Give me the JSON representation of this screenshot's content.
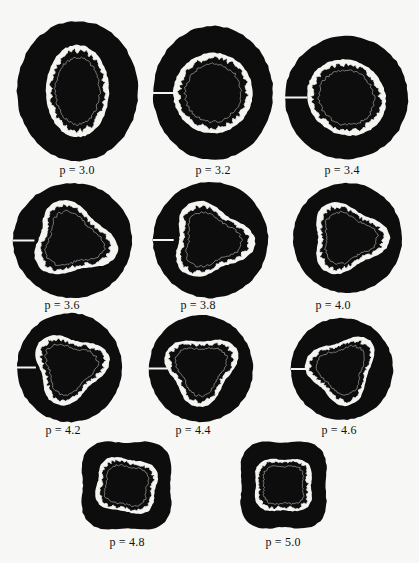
{
  "figure": {
    "title_clipped": "",
    "panels": [
      {
        "label": "p = 3.0",
        "p": 3.0,
        "x": 17,
        "y": 21,
        "w": 121,
        "h": 140,
        "lx": 77,
        "ly": 163,
        "shape": "oval-vertical",
        "rot": 0,
        "notch": false
      },
      {
        "label": "p = 3.2",
        "p": 3.2,
        "x": 153,
        "y": 26,
        "w": 120,
        "h": 134,
        "lx": 213,
        "ly": 163,
        "shape": "oval",
        "rot": 20,
        "notch": true
      },
      {
        "label": "p = 3.4",
        "p": 3.4,
        "x": 285,
        "y": 36,
        "w": 123,
        "h": 123,
        "lx": 342,
        "ly": 163,
        "shape": "oval",
        "rot": 35,
        "notch": true
      },
      {
        "label": "p = 3.6",
        "p": 3.6,
        "x": 13,
        "y": 183,
        "w": 119,
        "h": 115,
        "lx": 62,
        "ly": 298,
        "shape": "tri",
        "rot": 15,
        "notch": true
      },
      {
        "label": "p = 3.8",
        "p": 3.8,
        "x": 153,
        "y": 182,
        "w": 115,
        "h": 116,
        "lx": 198,
        "ly": 298,
        "shape": "tri",
        "rot": 5,
        "notch": true
      },
      {
        "label": "p = 4.0",
        "p": 4.0,
        "x": 293,
        "y": 183,
        "w": 109,
        "h": 110,
        "lx": 333,
        "ly": 298,
        "shape": "tri",
        "rot": 0,
        "notch": false
      },
      {
        "label": "p = 4.2",
        "p": 4.2,
        "x": 17,
        "y": 313,
        "w": 105,
        "h": 109,
        "lx": 63,
        "ly": 423,
        "shape": "tri",
        "rot": -15,
        "notch": true
      },
      {
        "label": "p = 4.4",
        "p": 4.4,
        "x": 149,
        "y": 315,
        "w": 104,
        "h": 107,
        "lx": 193,
        "ly": 423,
        "shape": "tri",
        "rot": -30,
        "notch": true
      },
      {
        "label": "p = 4.6",
        "p": 4.6,
        "x": 291,
        "y": 318,
        "w": 102,
        "h": 102,
        "lx": 339,
        "ly": 423,
        "shape": "tri",
        "rot": -45,
        "notch": true
      },
      {
        "label": "p = 4.8",
        "p": 4.8,
        "x": 78,
        "y": 438,
        "w": 97,
        "h": 95,
        "lx": 127,
        "ly": 535,
        "shape": "square",
        "rot": 10,
        "notch": false
      },
      {
        "label": "p = 5.0",
        "p": 5.0,
        "x": 237,
        "y": 438,
        "w": 93,
        "h": 94,
        "lx": 283,
        "ly": 535,
        "shape": "square",
        "rot": 0,
        "notch": false
      }
    ],
    "colors": {
      "background": "#f7f7f5",
      "ink": "#0d0d0d",
      "band": "#f4f4f0"
    }
  }
}
